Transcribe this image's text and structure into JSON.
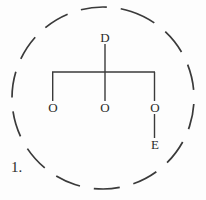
{
  "figure": {
    "item_number": "1.",
    "colors": {
      "background": "#fdfdfd",
      "ink": "#3a3a3a",
      "text": "#2b2b2b"
    },
    "enclosure": {
      "shape": "dashed-circle",
      "center_x": 103,
      "center_y": 98,
      "radius": 91,
      "dash_length": 26,
      "gap_length": 14,
      "stroke_width": 1.6
    },
    "tree": {
      "root": {
        "label": "D",
        "x": 105,
        "y": 38
      },
      "branch_bar": {
        "y": 72,
        "x_left": 52,
        "x_right": 155
      },
      "children": [
        {
          "label": "O",
          "x": 53,
          "y": 108
        },
        {
          "label": "O",
          "x": 105,
          "y": 108
        },
        {
          "label": "O",
          "x": 155,
          "y": 108
        }
      ],
      "leaf": {
        "label": "E",
        "x": 155,
        "y": 145,
        "parent_index": 2
      }
    }
  }
}
